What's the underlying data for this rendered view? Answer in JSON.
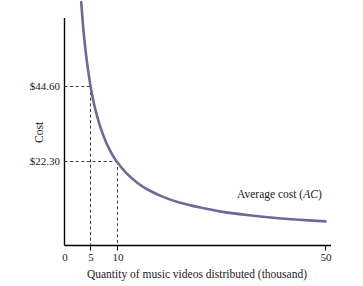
{
  "chart_data": {
    "type": "line",
    "title": "",
    "subtitle": "",
    "xlabel": "Quantity of music videos distributed (thousand)",
    "ylabel": "Cost",
    "xlim": [
      0,
      55
    ],
    "ylim": [
      0,
      100
    ],
    "grid": false,
    "legend_position": "inline-right",
    "xticks": [
      {
        "value": 0,
        "label": "0"
      },
      {
        "value": 5,
        "label": "5"
      },
      {
        "value": 10,
        "label": "10"
      },
      {
        "value": 50,
        "label": "50"
      }
    ],
    "yticks": [
      {
        "value": 22.3,
        "label": "$22.30"
      },
      {
        "value": 44.6,
        "label": "$44.60"
      }
    ],
    "series": [
      {
        "name": "Average cost (AC)",
        "name_plain": "Average cost",
        "name_abbrev": "AC",
        "color": "#6b6b96",
        "x": [
          3.2,
          3.6,
          4.0,
          4.5,
          5.0,
          5.5,
          6.0,
          7.0,
          8.0,
          9.0,
          10.0,
          12.0,
          14.0,
          16.0,
          19.0,
          22.0,
          26.0,
          30.0,
          35.0,
          40.0,
          45.0,
          50.0
        ],
        "y": [
          69.7,
          61.9,
          55.8,
          49.6,
          44.6,
          40.5,
          37.2,
          31.9,
          27.9,
          24.8,
          22.3,
          18.6,
          15.9,
          13.9,
          11.7,
          10.1,
          8.6,
          7.4,
          6.4,
          5.6,
          5.0,
          4.5
        ]
      }
    ],
    "annotations": [
      {
        "name": "reference-point-5",
        "x": 5,
        "y": 44.6,
        "x_label": "5",
        "y_label": "$44.60",
        "style": "dashed-guides"
      },
      {
        "name": "reference-point-10",
        "x": 10,
        "y": 22.3,
        "x_label": "10",
        "y_label": "$22.30",
        "style": "dashed-guides"
      }
    ]
  },
  "axes": {
    "y_title": "Cost",
    "x_title": "Quantity of music videos distributed (thousand)",
    "axis_color": "#000000",
    "guide_color": "#3a3a3a"
  },
  "ticks": {
    "x": {
      "zero": "0",
      "five": "5",
      "ten": "10",
      "fifty": "50"
    },
    "y": {
      "upper": "$44.60",
      "lower": "$22.30"
    }
  },
  "series_label": {
    "prefix": "Average cost (",
    "abbrev": "AC",
    "suffix": ")"
  }
}
